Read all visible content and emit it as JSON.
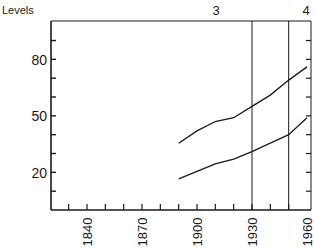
{
  "chart_data": {
    "type": "line",
    "title": "",
    "ylabel": "Levels",
    "xlabel": "",
    "xlim": [
      1830,
      1962
    ],
    "ylim": [
      0,
      100
    ],
    "x_ticks_labeled": [
      1840,
      1870,
      1900,
      1930,
      1960
    ],
    "x_tick_interval": 10,
    "y_ticks_labeled": [
      20,
      50,
      80
    ],
    "y_tick_interval": 10,
    "grid": false,
    "legend": null,
    "vertical_lines": [
      {
        "x": 1930,
        "label": "3"
      },
      {
        "x": 1950,
        "label": "4"
      }
    ],
    "top_labels": [
      "3",
      "4"
    ],
    "series": [
      {
        "name": "upper",
        "x": [
          1890,
          1900,
          1910,
          1920,
          1930,
          1940,
          1950,
          1960
        ],
        "values": [
          35.5,
          42,
          47,
          49,
          55,
          61,
          69,
          76
        ]
      },
      {
        "name": "lower",
        "x": [
          1890,
          1900,
          1910,
          1920,
          1930,
          1940,
          1950,
          1960
        ],
        "values": [
          16.5,
          20.5,
          24.5,
          27,
          31,
          35.5,
          40,
          49
        ]
      }
    ]
  },
  "labels": {
    "ylabel": "Levels",
    "top_3": "3",
    "top_4": "4",
    "y20": "20",
    "y50": "50",
    "y80": "80",
    "x1840": "1840",
    "x1870": "1870",
    "x1900": "1900",
    "x1930": "1930",
    "x1960": "1960"
  }
}
